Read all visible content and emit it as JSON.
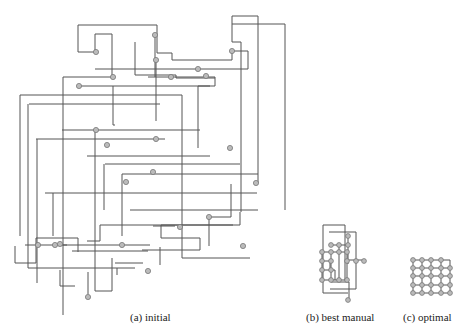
{
  "figure": {
    "panels": [
      {
        "id": "a",
        "caption": "(a) initial"
      },
      {
        "id": "b",
        "caption": "(b) best manual"
      },
      {
        "id": "c",
        "caption": "(c) optimal"
      }
    ],
    "colors": {
      "edge": "#555555",
      "node_fill": "#bbbbbb",
      "node_stroke": "#777777"
    }
  },
  "panel_a": {
    "edges": [
      "M78,25 H157 V53 H172 V60 H232 V51",
      "M78,25 V52 H95 V34 H112 V77 H63 V315",
      "M232,51 H248 V69 H95",
      "M155,35 V77",
      "M156,60 V121",
      "M148,77 H215 V86 H198 V148",
      "M232,16 H258 V183",
      "M232,16 V42 H241 V212",
      "M232,24 H285 V210",
      "M113,86 V125 H115",
      "M79,86 H210",
      "M135,42 V75 H176 V78 H215",
      "M20,95 H182 V258 H250",
      "M28,104 V268 H135",
      "M29,104 H160",
      "M62,130 H200",
      "M95,130 V291 H112 V258",
      "M37,139 V283",
      "M36,139 H165",
      "M87,156 H210",
      "M104,164 V210",
      "M105,164 H240",
      "M122,174 V236",
      "M122,174 H258",
      "M45,193 H257",
      "M53,193 V236",
      "M130,210 H258",
      "M160,247 V265",
      "M153,226 H175",
      "M25,245 H67",
      "M15,246 V263 H36 V238 H78 V252",
      "M20,95 V236",
      "M55,245 H150",
      "M72,251 H148",
      "M88,272 V294",
      "M142,250 H200 V238 H161 V225 H233",
      "M117,268 V275",
      "M115,263 H143",
      "M209,217 H231 V184",
      "M240,212 V225 H100 V241 H87",
      "M209,217 V246",
      "M60,270 V286 H75"
    ],
    "nodes": [
      [
        96,
        52
      ],
      [
        156,
        60
      ],
      [
        113,
        77
      ],
      [
        79,
        86
      ],
      [
        155,
        35
      ],
      [
        232,
        51
      ],
      [
        198,
        69
      ],
      [
        206,
        76
      ],
      [
        171,
        77
      ],
      [
        96,
        130
      ],
      [
        156,
        139
      ],
      [
        230,
        148
      ],
      [
        38,
        245
      ],
      [
        55,
        245
      ],
      [
        122,
        245
      ],
      [
        148,
        271
      ],
      [
        88,
        297
      ],
      [
        60,
        244
      ],
      [
        209,
        217
      ],
      [
        180,
        227
      ],
      [
        126,
        182
      ],
      [
        153,
        172
      ],
      [
        107,
        145
      ],
      [
        256,
        183
      ],
      [
        243,
        246
      ]
    ]
  },
  "panel_b": {
    "edges": [
      "M323,225 H345 V280",
      "M323,225 V293 H348",
      "M329,232 H356 V289 H330",
      "M348,236 V264",
      "M331,245 H348",
      "M322,252 H348",
      "M322,261 H330 V270",
      "M322,270 H335 V280",
      "M322,280 H346",
      "M347,260 H365",
      "M331,282 H349 V300",
      "M322,252 V282",
      "M331,252 V282",
      "M339,245 V282",
      "M347,252 V280"
    ],
    "nodes": [
      [
        348,
        236
      ],
      [
        331,
        245
      ],
      [
        339,
        245
      ],
      [
        348,
        245
      ],
      [
        322,
        252
      ],
      [
        331,
        252
      ],
      [
        339,
        252
      ],
      [
        347,
        252
      ],
      [
        322,
        261
      ],
      [
        331,
        261
      ],
      [
        347,
        261
      ],
      [
        356,
        261
      ],
      [
        364,
        261
      ],
      [
        322,
        270
      ],
      [
        331,
        270
      ],
      [
        322,
        280
      ],
      [
        331,
        280
      ],
      [
        339,
        280
      ],
      [
        347,
        280
      ],
      [
        348,
        300
      ]
    ]
  },
  "panel_c": {
    "edges": [
      "M413,260 H450 V293",
      "M413,260 V293 H450",
      "M413,268 H450",
      "M413,276 H450",
      "M413,285 H450",
      "M422,260 V293",
      "M431,260 V293",
      "M441,260 V293"
    ],
    "nodes": [
      [
        413,
        260
      ],
      [
        422,
        260
      ],
      [
        431,
        260
      ],
      [
        441,
        260
      ],
      [
        413,
        268
      ],
      [
        422,
        268
      ],
      [
        431,
        268
      ],
      [
        441,
        268
      ],
      [
        450,
        268
      ],
      [
        413,
        276
      ],
      [
        422,
        276
      ],
      [
        431,
        276
      ],
      [
        441,
        276
      ],
      [
        450,
        276
      ],
      [
        413,
        285
      ],
      [
        422,
        285
      ],
      [
        431,
        285
      ],
      [
        441,
        285
      ],
      [
        450,
        285
      ],
      [
        413,
        293
      ],
      [
        422,
        293
      ],
      [
        431,
        293
      ],
      [
        441,
        293
      ],
      [
        450,
        293
      ]
    ]
  }
}
